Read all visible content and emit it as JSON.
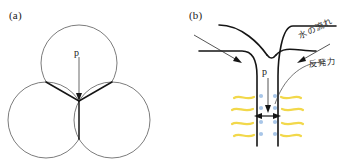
{
  "figure": {
    "panels": [
      {
        "id": "a",
        "label": "(a)",
        "point_label": "p",
        "description": "three mutually tangent circles meeting at a Y junction"
      },
      {
        "id": "b",
        "label": "(b)",
        "point_label": "p",
        "annotations": [
          {
            "name": "water-flow",
            "text": "水の流れ"
          },
          {
            "name": "repulsive-force",
            "text": "反発力"
          }
        ]
      }
    ]
  },
  "colors": {
    "outline": "#4a4a4a",
    "contact_line": "#1a1a1a",
    "channel_wall": "#1a1a1a",
    "arrow": "#1a1a1a",
    "squiggle_yellow": "#f2d84b",
    "dot_blue": "#a8c6e8",
    "background": "#ffffff"
  },
  "geometry": {
    "panel_a": {
      "circle_radius": 38,
      "circles": [
        {
          "name": "top",
          "cx": 79,
          "cy": 63
        },
        {
          "name": "bottom-left",
          "cx": 46,
          "cy": 120
        },
        {
          "name": "bottom-right",
          "cx": 112,
          "cy": 120
        }
      ],
      "junction": {
        "x": 79,
        "y": 101
      },
      "arrow": {
        "x": 79,
        "y1": 57,
        "y2": 99
      }
    },
    "panel_b": {
      "throat": {
        "x_left": 77,
        "x_right": 98
      },
      "double_arrow_y": 116,
      "squiggle_count": 4,
      "dot_count": 4
    }
  }
}
